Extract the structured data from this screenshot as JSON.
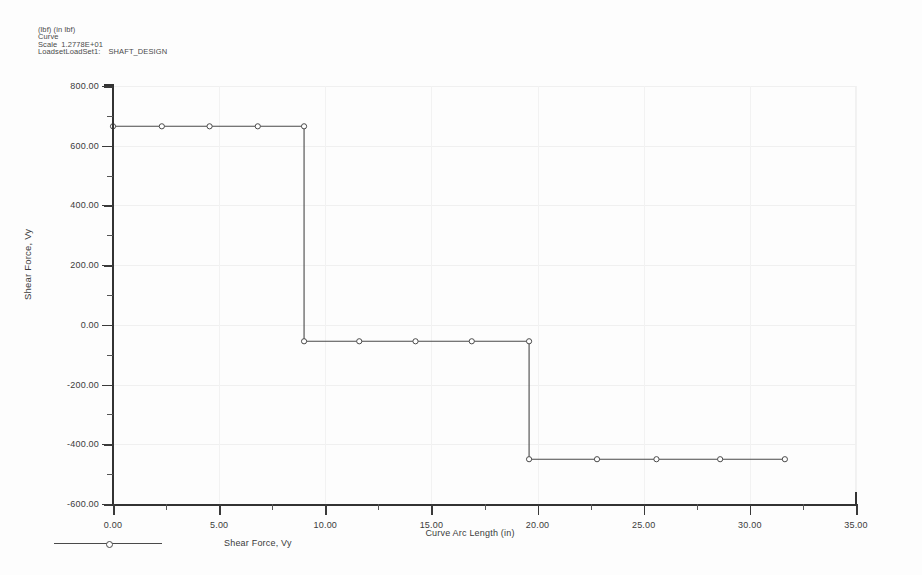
{
  "header": {
    "units": "(lbf)  (in lbf)",
    "curve": "Curve",
    "scale_label": "Scale",
    "scale_value": "1.2778E+01",
    "loadset_label": "LoadsetLoadSet1",
    "loadset_sep": ":",
    "loadset_value": "SHAFT_DESIGN"
  },
  "legend": {
    "entry_label": "Shear Force, Vy"
  },
  "chart_data": {
    "type": "line",
    "title": "",
    "subtitle": "LoadsetLoadSet1 : SHAFT_DESIGN",
    "xlabel": "Curve Arc Length (in)",
    "ylabel": "Shear Force, Vy",
    "xlim": [
      0.0,
      35.0
    ],
    "ylim": [
      -600.0,
      800.0
    ],
    "xticks": [
      0.0,
      5.0,
      10.0,
      15.0,
      20.0,
      25.0,
      30.0,
      35.0
    ],
    "xticklabels": [
      "0.00",
      "5.00",
      "10.00",
      "15.00",
      "20.00",
      "25.00",
      "30.00",
      "35.00"
    ],
    "yticks": [
      -600.0,
      -400.0,
      -200.0,
      0.0,
      200.0,
      400.0,
      600.0,
      800.0
    ],
    "yticklabels": [
      "-600.00",
      "-400.00",
      "-200.00",
      "0.00",
      "200.00",
      "400.00",
      "600.00",
      "800.00"
    ],
    "x_minor_tick_interval": 2.5,
    "y_minor_tick_interval": 100.0,
    "grid": true,
    "grid_color": "#f0f0f0",
    "legend_position": "below-left",
    "line_color": "#4a4a4a",
    "marker": "circle",
    "marker_facecolor": "#ffffff",
    "series": [
      {
        "name": "Shear Force, Vy",
        "x": [
          0.0,
          2.3,
          4.55,
          6.82,
          9.0,
          9.0,
          9.0,
          11.6,
          14.25,
          16.9,
          19.6,
          19.6,
          19.6,
          22.8,
          25.6,
          28.6,
          31.65
        ],
        "y": [
          665,
          665,
          665,
          665,
          665,
          665,
          -55,
          -55,
          -55,
          -55,
          -55,
          -55,
          -450,
          -450,
          -450,
          -450,
          -450
        ]
      }
    ],
    "annotations": [
      "Step 1: constant shear 665 lbf from 0.00 to 9.00 in",
      "Step 2: constant shear -55 lbf from 9.00 to 19.60 in",
      "Step 3: constant shear -450 lbf from 19.60 to 31.65 in"
    ]
  }
}
